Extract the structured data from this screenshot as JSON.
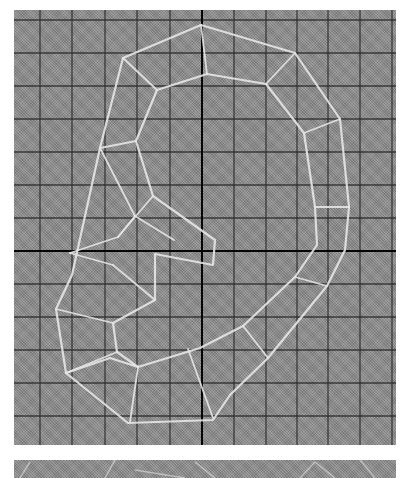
{
  "figure": {
    "type": "wireframe-mesh-on-grid",
    "colors": {
      "background": "#ffffff",
      "panel_fill": "#8c8c8c",
      "grid_line": "#2a2a2a",
      "axis_line": "#050505",
      "mesh_line": "#e6e6e6"
    },
    "grid": {
      "vertical_x": [
        40,
        72,
        105,
        137,
        170,
        234,
        266,
        297,
        328,
        360,
        392
      ],
      "horizontal_y": [
        20,
        53,
        86,
        119,
        152,
        185,
        218,
        284,
        317,
        350,
        383,
        416
      ],
      "center_vertical_x": 202,
      "center_horizontal_y": 251
    },
    "mesh": {
      "outer_contour": [
        [
          201,
          25
        ],
        [
          295,
          53
        ],
        [
          340,
          119
        ],
        [
          349,
          207
        ],
        [
          345,
          250
        ],
        [
          327,
          286
        ],
        [
          268,
          358
        ],
        [
          230,
          395
        ],
        [
          213,
          420
        ],
        [
          128,
          423
        ],
        [
          66,
          373
        ],
        [
          56,
          309
        ],
        [
          72,
          275
        ],
        [
          100,
          148
        ],
        [
          123,
          58
        ],
        [
          201,
          25
        ]
      ],
      "inner_contour": [
        [
          207,
          74
        ],
        [
          266,
          84
        ],
        [
          304,
          133
        ],
        [
          315,
          207
        ],
        [
          317,
          245
        ],
        [
          295,
          277
        ],
        [
          243,
          326
        ],
        [
          200,
          348
        ],
        [
          138,
          367
        ],
        [
          110,
          358
        ],
        [
          66,
          373
        ]
      ],
      "inner_top": [
        [
          207,
          74
        ],
        [
          157,
          90
        ],
        [
          136,
          141
        ],
        [
          153,
          196
        ],
        [
          215,
          240
        ],
        [
          213,
          265
        ],
        [
          155,
          254
        ],
        [
          155,
          300
        ],
        [
          113,
          323
        ],
        [
          117,
          352
        ],
        [
          138,
          367
        ]
      ],
      "spokes": [
        [
          [
            201,
            25
          ],
          [
            207,
            74
          ]
        ],
        [
          [
            123,
            58
          ],
          [
            157,
            90
          ]
        ],
        [
          [
            295,
            53
          ],
          [
            266,
            84
          ]
        ],
        [
          [
            340,
            119
          ],
          [
            304,
            133
          ]
        ],
        [
          [
            349,
            207
          ],
          [
            315,
            207
          ]
        ],
        [
          [
            327,
            286
          ],
          [
            295,
            277
          ]
        ],
        [
          [
            268,
            358
          ],
          [
            243,
            326
          ]
        ],
        [
          [
            213,
            418
          ],
          [
            188,
            349
          ]
        ],
        [
          [
            130,
            422
          ],
          [
            138,
            367
          ]
        ],
        [
          [
            100,
            148
          ],
          [
            136,
            141
          ]
        ],
        [
          [
            100,
            148
          ],
          [
            135,
            216
          ]
        ],
        [
          [
            135,
            216
          ],
          [
            174,
            240
          ]
        ],
        [
          [
            135,
            216
          ],
          [
            118,
            237
          ]
        ],
        [
          [
            118,
            237
          ],
          [
            70,
            253
          ]
        ],
        [
          [
            153,
            196
          ],
          [
            118,
            237
          ]
        ],
        [
          [
            70,
            253
          ],
          [
            113,
            265
          ]
        ],
        [
          [
            113,
            265
          ],
          [
            155,
            300
          ]
        ],
        [
          [
            56,
            309
          ],
          [
            113,
            323
          ]
        ],
        [
          [
            66,
            373
          ],
          [
            117,
            352
          ]
        ]
      ]
    },
    "bottom_panel": {
      "visible_height": 18,
      "mesh_fragments": [
        [
          [
            20,
            478
          ],
          [
            30,
            462
          ]
        ],
        [
          [
            105,
            478
          ],
          [
            115,
            460
          ]
        ],
        [
          [
            135,
            470
          ],
          [
            185,
            478
          ]
        ],
        [
          [
            195,
            462
          ],
          [
            215,
            478
          ]
        ],
        [
          [
            300,
            478
          ],
          [
            315,
            462
          ]
        ],
        [
          [
            315,
            462
          ],
          [
            335,
            478
          ]
        ],
        [
          [
            360,
            460
          ],
          [
            375,
            478
          ]
        ]
      ]
    }
  }
}
